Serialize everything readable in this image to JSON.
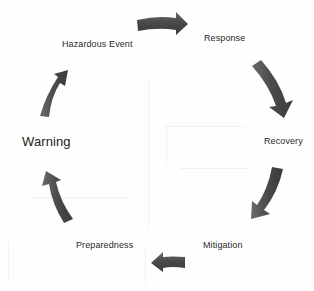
{
  "diagram": {
    "type": "cycle",
    "direction": "clockwise",
    "arrow_color": "#4a4a4a",
    "arrow_highlight": "#6b6b6b",
    "stages": [
      {
        "id": "hazardous-event",
        "label": "Hazardous Event"
      },
      {
        "id": "response",
        "label": "Response"
      },
      {
        "id": "recovery",
        "label": "Recovery"
      },
      {
        "id": "mitigation",
        "label": "Mitigation"
      },
      {
        "id": "preparedness",
        "label": "Preparedness"
      },
      {
        "id": "warning",
        "label": "Warning"
      }
    ],
    "arrows": [
      {
        "from": "Hazardous Event",
        "to": "Response",
        "icon": "arrow-right-icon"
      },
      {
        "from": "Response",
        "to": "Recovery",
        "icon": "arrow-down-right-icon"
      },
      {
        "from": "Recovery",
        "to": "Mitigation",
        "icon": "arrow-down-left-icon"
      },
      {
        "from": "Mitigation",
        "to": "Preparedness",
        "icon": "arrow-left-icon"
      },
      {
        "from": "Preparedness",
        "to": "Warning",
        "icon": "arrow-up-left-icon"
      },
      {
        "from": "Warning",
        "to": "Hazardous Event",
        "icon": "arrow-up-right-icon"
      }
    ]
  }
}
